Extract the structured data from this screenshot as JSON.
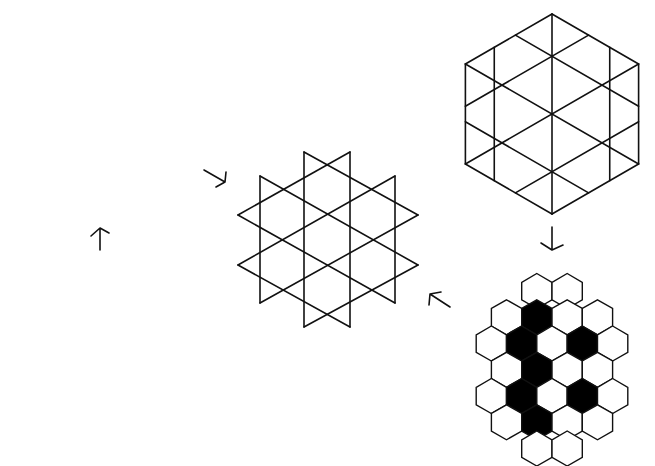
{
  "page": {
    "number": "101"
  },
  "figures": {
    "truncated_hexagonal": {
      "label": "truncated hexagonal tiling (dodecagons with triangles)",
      "cells": 7
    },
    "triangular": {
      "label": "triangular lattice hexagon",
      "side_divisions": 3
    },
    "kagome": {
      "label": "kagome / star-of-David lattice"
    },
    "honeycomb": {
      "label": "honeycomb lattice",
      "cells": 7
    },
    "colored_honeycomb": {
      "label": "honeycomb with black sublattice",
      "rows": [
        2,
        4,
        5,
        4,
        5,
        4,
        3,
        2
      ],
      "black_cells": 7
    }
  },
  "arrows": [
    {
      "id": "honeycomb-to-truncated",
      "direction": "up"
    },
    {
      "id": "truncated-to-kagome",
      "direction": "down-right"
    },
    {
      "id": "triangular-to-colored",
      "direction": "down"
    },
    {
      "id": "colored-to-kagome",
      "direction": "up-left"
    }
  ],
  "colors": {
    "line": "#111111",
    "fill_black": "#000000",
    "background": "#ffffff"
  }
}
